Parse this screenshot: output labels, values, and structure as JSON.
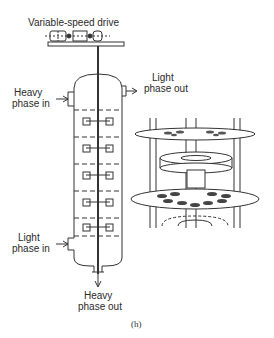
{
  "figure": {
    "caption": "(h)",
    "labels": {
      "drive": "Variable-speed drive",
      "heavy_in_1": "Heavy",
      "heavy_in_2": "phase in",
      "light_out_1": "Light",
      "light_out_2": "phase out",
      "light_in_1": "Light",
      "light_in_2": "phase in",
      "heavy_out_1": "Heavy",
      "heavy_out_2": "phase out"
    },
    "column": {
      "stages": 5,
      "component": "rotating-disc-contactor column with central shaft and impellers"
    },
    "detail_view": {
      "component": "cutaway of stator rings, rotor disc and perforated plates"
    },
    "colors": {
      "line": "#333333",
      "background": "#ffffff"
    }
  }
}
